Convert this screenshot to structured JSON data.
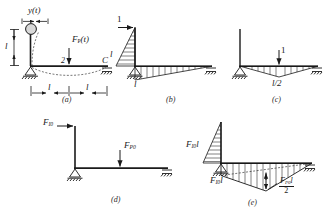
{
  "figure": {
    "kind": "structural-mechanics-diagram",
    "ink_color": "#1a1a1a",
    "panels": [
      {
        "id": "a",
        "caption": "(a)",
        "description": "frame with lumped mass on column, dynamic load on beam",
        "labels": {
          "displacement": "y(t)",
          "column_height": "l",
          "dynamic_load": "F",
          "dynamic_load_sub": "P",
          "dynamic_load_arg": "(t)",
          "node_2": "2",
          "node_C": "C",
          "span_left": "l",
          "span_right": "l"
        }
      },
      {
        "id": "b",
        "caption": "(b)",
        "description": "unit horizontal load at top of column, M1 bending moment diagram",
        "labels": {
          "unit_load": "1",
          "column_ordinate": "l",
          "beam_ordinate": "l"
        }
      },
      {
        "id": "c",
        "caption": "(c)",
        "description": "unit vertical load at beam midspan, M2 bending moment diagram",
        "labels": {
          "unit_load": "1",
          "midspan_ordinate": "l/2",
          "midspan_num": "l",
          "midspan_den": "2"
        }
      },
      {
        "id": "d",
        "caption": "(d)",
        "description": "amplitude forces applied to the frame",
        "labels": {
          "inertia_force": "F",
          "inertia_force_sub": "I0",
          "load_force": "F",
          "load_force_sub": "P0"
        }
      },
      {
        "id": "e",
        "caption": "(e)",
        "description": "resultant amplitude bending moment diagram",
        "labels": {
          "column_moment": "F",
          "column_moment_sub": "I0",
          "column_moment_len": "l",
          "beam_moment": "F",
          "beam_moment_sub": "I0",
          "beam_moment_len": "l",
          "span_moment_num": "F",
          "span_moment_num_sub": "P0",
          "span_moment_num_len": "l",
          "span_moment_den": "2"
        }
      }
    ]
  }
}
